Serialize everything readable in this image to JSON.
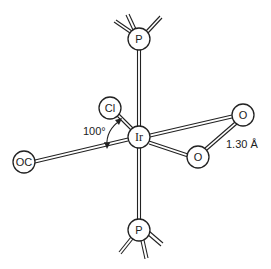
{
  "diagram": {
    "type": "molecular-structure",
    "central_atom": "Ir",
    "atoms": [
      {
        "id": "p_top",
        "label": "P"
      },
      {
        "id": "cl",
        "label": "Cl"
      },
      {
        "id": "ir",
        "label": "Ir"
      },
      {
        "id": "oc",
        "label": "OC"
      },
      {
        "id": "o_upper",
        "label": "O"
      },
      {
        "id": "o_lower",
        "label": "O"
      },
      {
        "id": "p_bottom",
        "label": "P"
      }
    ],
    "annotations": {
      "angle": "100°",
      "bond_length": "1.30 Å"
    },
    "colors": {
      "line": "#222222",
      "background": "#ffffff"
    }
  }
}
